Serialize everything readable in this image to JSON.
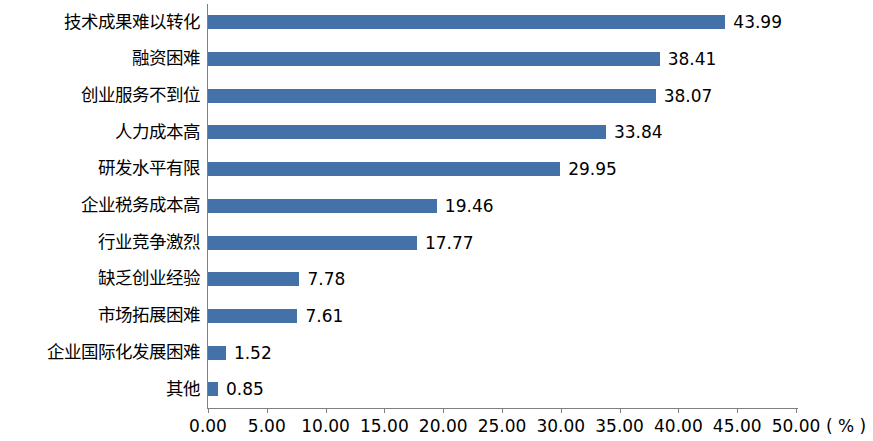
{
  "chart_data": {
    "type": "bar",
    "orientation": "horizontal",
    "title": "",
    "subtitle": "",
    "xlabel": "",
    "ylabel": "",
    "unit_label": "( % )",
    "xlim": [
      0,
      50
    ],
    "xticks": [
      "0.00",
      "5.00",
      "10.00",
      "15.00",
      "20.00",
      "25.00",
      "30.00",
      "35.00",
      "40.00",
      "45.00",
      "50.00"
    ],
    "grid": false,
    "legend": "none",
    "bar_color": "#4472a8",
    "categories": [
      "技术成果难以转化",
      "融资困难",
      "创业服务不到位",
      "人力成本高",
      "研发水平有限",
      "企业税务成本高",
      "行业竞争激烈",
      "缺乏创业经验",
      "市场拓展困难",
      "企业国际化发展困难",
      "其他"
    ],
    "values": [
      43.99,
      38.41,
      38.07,
      33.84,
      29.95,
      19.46,
      17.77,
      7.78,
      7.61,
      1.52,
      0.85
    ],
    "value_labels": [
      "43.99",
      "38.41",
      "38.07",
      "33.84",
      "29.95",
      "19.46",
      "17.77",
      "7.78",
      "7.61",
      "1.52",
      "0.85"
    ]
  }
}
